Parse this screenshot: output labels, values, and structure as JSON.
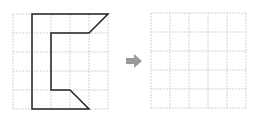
{
  "diagram": {
    "grid_size": 5,
    "cell_px": 19,
    "colors": {
      "grid_line": "#c8c8c8",
      "shape_stroke": "#222222",
      "arrow": "#9a9a9a",
      "background": "#ffffff"
    },
    "source_grid": {
      "origin": [
        13,
        14
      ],
      "shape_vertices": [
        [
          1,
          0
        ],
        [
          5,
          0
        ],
        [
          4,
          1
        ],
        [
          2,
          1
        ],
        [
          2,
          4
        ],
        [
          3,
          4
        ],
        [
          4,
          5
        ],
        [
          1,
          5
        ]
      ]
    },
    "arrow": {
      "icon": "right-arrow-icon",
      "center": [
        135,
        61
      ]
    },
    "target_grid": {
      "origin": [
        151,
        13
      ],
      "shape_vertices": []
    }
  }
}
